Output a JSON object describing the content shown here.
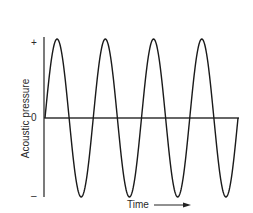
{
  "chart_data": {
    "type": "line",
    "title": "",
    "xlabel": "Time",
    "ylabel": "Acoustic pressure",
    "y_tick_labels": [
      "+",
      "0",
      "–"
    ],
    "x_tick_labels": [],
    "grid": false,
    "legend": null,
    "series": [
      {
        "name": "sine wave",
        "function": "sin",
        "cycles": 4,
        "amplitude": 1,
        "x": [
          0,
          0.25,
          0.5,
          0.75,
          1,
          1.25,
          1.5,
          1.75,
          2,
          2.25,
          2.5,
          2.75,
          3,
          3.25,
          3.5,
          3.75,
          4
        ],
        "values": [
          0,
          1,
          0,
          -1,
          0,
          1,
          0,
          -1,
          0,
          1,
          0,
          -1,
          0,
          1,
          0,
          -1,
          0
        ]
      }
    ],
    "ylim": [
      -1,
      1
    ],
    "xlim": [
      0,
      4
    ],
    "color": "#1a1a1a"
  },
  "labels": {
    "y_axis": "Acoustic pressure",
    "x_axis": "Time",
    "plus": "+",
    "zero": "0",
    "minus": "–"
  }
}
